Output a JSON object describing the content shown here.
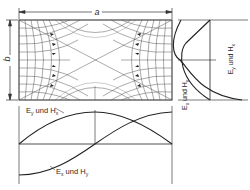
{
  "diagram": {
    "dimension_a": "a",
    "dimension_b": "b",
    "bottom_plot": {
      "label_upper": "E",
      "label_upper_sub": "y",
      "label_upper_mid": " und H",
      "label_upper_sub2": "x",
      "label_lower": "E",
      "label_lower_sub": "x",
      "label_lower_mid": " und H",
      "label_lower_sub2": "y"
    },
    "right_plot": {
      "label_a": "E",
      "label_a_sub": "y",
      "label_a_mid": " und H",
      "label_a_sub2": "x",
      "label_b": "E",
      "label_b_sub": "x",
      "label_b_mid": " und H",
      "label_b_sub2": "y"
    },
    "colors": {
      "line": "#2a2a2a",
      "mesh": "#555555",
      "background": "#ffffff"
    }
  }
}
